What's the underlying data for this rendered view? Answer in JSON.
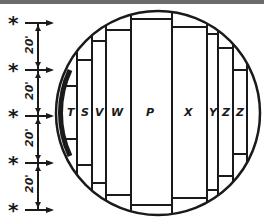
{
  "colors": {
    "ink": "#1a1a1a",
    "background": "#ffffff",
    "top_rule": "#6b6b6b"
  },
  "scale": {
    "marker_symbol": "*",
    "markers": 5,
    "intervals": [
      "20'",
      "20'",
      "20'",
      "20'"
    ]
  },
  "boards": [
    {
      "label": "T"
    },
    {
      "label": "S"
    },
    {
      "label": "V"
    },
    {
      "label": "W"
    },
    {
      "label": "P"
    },
    {
      "label": "X"
    },
    {
      "label": "Y"
    },
    {
      "label": "Z"
    },
    {
      "label": "Z"
    }
  ]
}
